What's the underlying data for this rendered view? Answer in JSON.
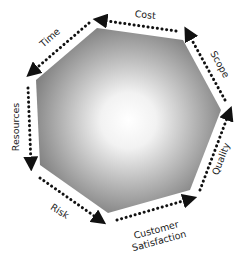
{
  "diagram": {
    "type": "heptagon-cycle",
    "center_shape": "heptagon with radial gradient (white center, gray edges)",
    "colors": {
      "gradient_center": "#ffffff",
      "gradient_edge": "#7a7a7a",
      "arrow": "#111111",
      "text": "#222222"
    },
    "flow_direction": "counter-clockwise",
    "sides": [
      {
        "id": "cost",
        "label": "Cost"
      },
      {
        "id": "time",
        "label": "Time"
      },
      {
        "id": "resources",
        "label": "Resources"
      },
      {
        "id": "risk",
        "label": "Risk"
      },
      {
        "id": "customer-satisfaction",
        "label_line1": "Customer",
        "label_line2": "Satisfaction"
      },
      {
        "id": "quality",
        "label": "Quality"
      },
      {
        "id": "scope",
        "label": "Scope"
      }
    ]
  }
}
